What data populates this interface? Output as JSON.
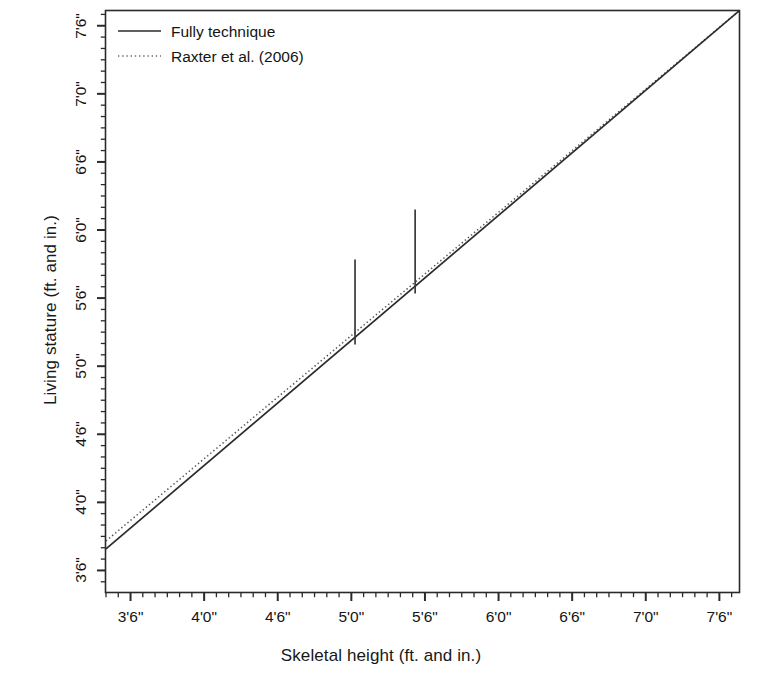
{
  "chart_data": {
    "type": "line",
    "title": "",
    "xlabel": "Skeletal height (ft. and in.)",
    "ylabel": "Living stature (ft. and in.)",
    "grid": false,
    "x_tick_labels": [
      "3'6\"",
      "4'0\"",
      "4'6\"",
      "5'0\"",
      "5'6\"",
      "6'0\"",
      "6'6\"",
      "7'0\"",
      "7'6\""
    ],
    "y_tick_labels": [
      "3'6\"",
      "4'0\"",
      "4'6\"",
      "5'0\"",
      "5'6\"",
      "6'0\"",
      "6'6\"",
      "7'0\"",
      "7'6\""
    ],
    "x_tick_values_in": [
      42,
      48,
      54,
      60,
      66,
      72,
      78,
      84,
      90
    ],
    "y_tick_values_in": [
      42,
      48,
      54,
      60,
      66,
      72,
      78,
      84,
      90
    ],
    "xlim_in": [
      40.0,
      91.6
    ],
    "ylim_in": [
      40.1,
      91.3
    ],
    "minor_tick_step_in": 1,
    "axis_units": "inches",
    "legend_position": "top-left",
    "series": [
      {
        "name": "Fully technique",
        "style": "solid",
        "color": "#2b2b2b",
        "x_in": [
          40.0,
          91.6
        ],
        "y_in": [
          43.9,
          91.3
        ],
        "slope": 0.922,
        "intercept_in": 7.0
      },
      {
        "name": "Raxter et al. (2006)",
        "style": "dotted",
        "color": "#555555",
        "x_in": [
          40.0,
          91.6
        ],
        "y_in": [
          44.6,
          91.3
        ],
        "slope": 0.907,
        "intercept_in": 8.3
      }
    ],
    "error_bars": [
      {
        "x_in": 60.3,
        "y_center_in": 65.6,
        "y_low_in": 61.9,
        "y_high_in": 69.4,
        "color": "#3a3a3a"
      },
      {
        "x_in": 65.2,
        "y_center_in": 70.1,
        "y_low_in": 66.4,
        "y_high_in": 73.8,
        "color": "#3a3a3a"
      }
    ]
  },
  "legend": {
    "items": [
      {
        "label": "Fully technique",
        "style": "solid"
      },
      {
        "label": "Raxter et al. (2006)",
        "style": "dotted"
      }
    ]
  },
  "axes": {
    "x_title": "Skeletal height (ft. and in.)",
    "y_title": "Living stature (ft. and in.)"
  }
}
